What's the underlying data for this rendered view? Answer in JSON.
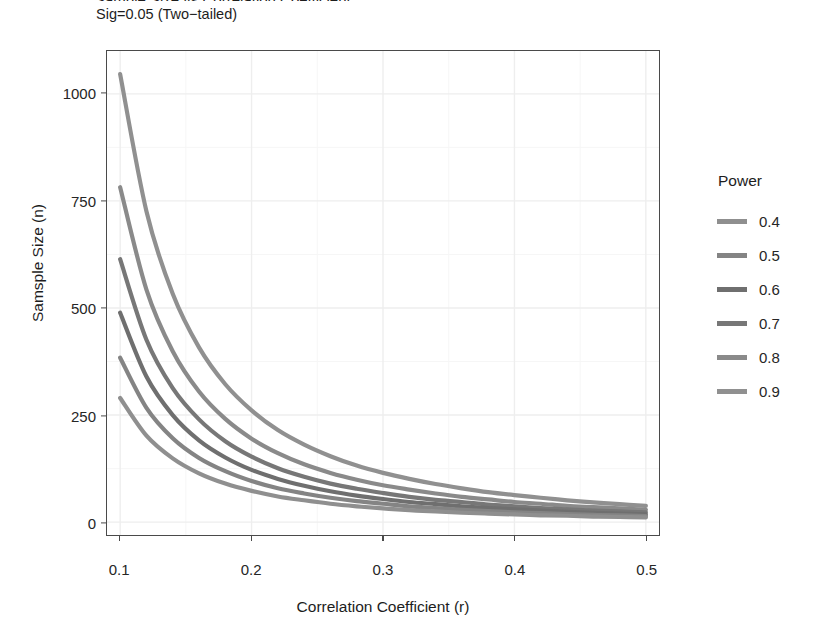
{
  "figure": {
    "title": "Sample Size vs Correlation Coefficient",
    "subtitle": "Sig=0.05 (Two−tailed)",
    "background_color": "#ffffff",
    "panel_border_color": "#4a4a4a",
    "grid_major_color": "#eeeeee",
    "grid_minor_color": "#f6f6f6"
  },
  "legend": {
    "title": "Power",
    "position": "right",
    "items": [
      {
        "label": "0.4",
        "color": "#8f8f8f"
      },
      {
        "label": "0.5",
        "color": "#848484"
      },
      {
        "label": "0.6",
        "color": "#6f6f6f"
      },
      {
        "label": "0.7",
        "color": "#777777"
      },
      {
        "label": "0.8",
        "color": "#8a8a8a"
      },
      {
        "label": "0.9",
        "color": "#909090"
      }
    ]
  },
  "chart_data": {
    "type": "line",
    "title": "Sample Size vs Correlation Coefficient",
    "subtitle": "Sig=0.05 (Two−tailed)",
    "xlabel": "Correlation Coefficient (r)",
    "ylabel": "Samsple Size (n)",
    "xlim": [
      0.09,
      0.51
    ],
    "ylim": [
      -30,
      1100
    ],
    "xticks": [
      0.1,
      0.2,
      0.3,
      0.4,
      0.5
    ],
    "xtick_labels": [
      "0.1",
      "0.2",
      "0.3",
      "0.4",
      "0.5"
    ],
    "yticks": [
      0,
      250,
      500,
      750,
      1000
    ],
    "ytick_labels": [
      "0",
      "250",
      "500",
      "750",
      "1000"
    ],
    "grid": true,
    "legend_title": "Power",
    "x": [
      0.1,
      0.12,
      0.14,
      0.16,
      0.18,
      0.2,
      0.22,
      0.24,
      0.26,
      0.28,
      0.3,
      0.32,
      0.34,
      0.36,
      0.38,
      0.4,
      0.42,
      0.44,
      0.46,
      0.48,
      0.5
    ],
    "series": [
      {
        "name": "0.9",
        "color": "#909090",
        "values": [
          1046,
          726,
          533,
          408,
          322,
          261,
          215,
          181,
          154,
          132,
          115,
          101,
          89,
          79,
          70,
          63,
          57,
          51,
          46,
          42,
          38
        ]
      },
      {
        "name": "0.8",
        "color": "#8a8a8a",
        "values": [
          782,
          543,
          399,
          305,
          241,
          195,
          161,
          135,
          115,
          99,
          86,
          76,
          67,
          59,
          53,
          47,
          43,
          38,
          35,
          32,
          29
        ]
      },
      {
        "name": "0.7",
        "color": "#777777",
        "values": [
          614,
          426,
          313,
          240,
          189,
          153,
          126,
          106,
          90,
          78,
          68,
          59,
          52,
          47,
          41,
          37,
          33,
          30,
          27,
          25,
          23
        ]
      },
      {
        "name": "0.6",
        "color": "#6f6f6f",
        "values": [
          489,
          340,
          250,
          191,
          151,
          122,
          101,
          85,
          72,
          62,
          54,
          47,
          42,
          37,
          33,
          30,
          27,
          24,
          22,
          20,
          18
        ]
      },
      {
        "name": "0.5",
        "color": "#848484",
        "values": [
          384,
          267,
          196,
          150,
          119,
          96,
          79,
          67,
          57,
          49,
          43,
          37,
          33,
          29,
          26,
          23,
          21,
          19,
          17,
          16,
          14
        ]
      },
      {
        "name": "0.4",
        "color": "#8f8f8f",
        "values": [
          290,
          202,
          149,
          114,
          90,
          73,
          60,
          51,
          43,
          37,
          32,
          28,
          25,
          22,
          20,
          18,
          16,
          15,
          13,
          12,
          11
        ]
      }
    ]
  }
}
